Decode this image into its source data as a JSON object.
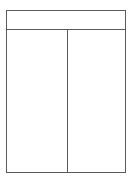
{
  "diagram": {
    "type": "two-column-table-frame",
    "header": {
      "label": ""
    },
    "columns": [
      {
        "label": ""
      },
      {
        "label": ""
      }
    ],
    "colors": {
      "line": "#5a5a5a",
      "background": "#ffffff"
    }
  }
}
